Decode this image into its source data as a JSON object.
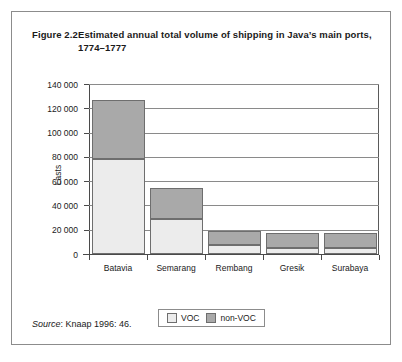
{
  "figure": {
    "number": "Figure 2.2",
    "title_line1": "Estimated annual total volume of shipping in Java’s main ports,",
    "title_line2": "1774–1777",
    "source_label": "Source",
    "source_text": ": Knaap 1996: 46."
  },
  "colors": {
    "voc": "#ececec",
    "non_voc": "#a9a9a9",
    "border": "#6e6e6e",
    "grid": "#8a8a8a",
    "axis": "#4a4a4a",
    "frame": "#8c8c8c"
  },
  "chart_data": {
    "type": "bar",
    "subtype": "stacked",
    "title": "Estimated annual total volume of shipping in Java’s main ports, 1774–1777",
    "xlabel": "",
    "ylabel": "Lasts",
    "ylim": [
      0,
      140000
    ],
    "ytick_step": 20000,
    "ytick_labels": [
      "0",
      "20 000",
      "40 000",
      "60 000",
      "80 000",
      "100 000",
      "120 000",
      "140 000"
    ],
    "ytick_values": [
      0,
      20000,
      40000,
      60000,
      80000,
      100000,
      120000,
      140000
    ],
    "grid": "horizontal",
    "legend_position": "bottom",
    "categories": [
      "Batavia",
      "Semarang",
      "Rembang",
      "Gresik",
      "Surabaya"
    ],
    "series": [
      {
        "name": "VOC",
        "color": "#ececec",
        "values": [
          78500,
          28500,
          7500,
          5000,
          5000
        ]
      },
      {
        "name": "non-VOC",
        "color": "#a9a9a9",
        "values": [
          48500,
          25500,
          11500,
          12500,
          12000
        ]
      }
    ],
    "totals": [
      127000,
      54000,
      19000,
      17500,
      17000
    ]
  }
}
